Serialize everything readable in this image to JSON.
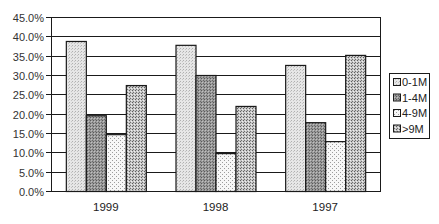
{
  "chart_data": {
    "type": "bar",
    "title": "",
    "xlabel": "",
    "ylabel": "",
    "categories": [
      "1999",
      "1998",
      "1997"
    ],
    "series": [
      {
        "name": "0-1M",
        "values": [
          38.8,
          37.8,
          32.6
        ],
        "pattern": "light-dots",
        "color": "#d9d9d9"
      },
      {
        "name": "1-4M",
        "values": [
          19.6,
          30.0,
          17.8
        ],
        "pattern": "dark-dots",
        "color": "#8c8c8c"
      },
      {
        "name": "4-9M",
        "values": [
          14.7,
          9.8,
          12.9
        ],
        "pattern": "sparse-dots",
        "color": "#f2f2f2"
      },
      {
        "name": ">9M",
        "values": [
          27.4,
          22.0,
          35.2
        ],
        "pattern": "coarse-dots",
        "color": "#b3b3b3"
      }
    ],
    "ylim": [
      0,
      45
    ],
    "yticks": [
      "0.0%",
      "5.0%",
      "10.0%",
      "15.0%",
      "20.0%",
      "25.0%",
      "30.0%",
      "35.0%",
      "40.0%",
      "45.0%"
    ],
    "grid": true,
    "legend_position": "right"
  },
  "legend": {
    "items": [
      "0-1M",
      "1-4M",
      "4-9M",
      ">9M"
    ]
  }
}
